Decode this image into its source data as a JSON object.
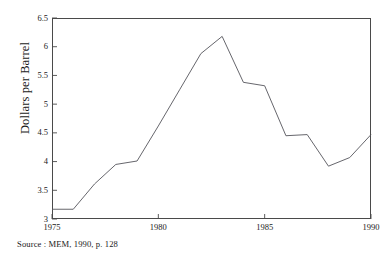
{
  "figure": {
    "source_note": "Source : MEM, 1990, p. 128"
  },
  "chart_data": {
    "type": "line",
    "title": "",
    "xlabel": "",
    "ylabel": "Dollars per Barrel",
    "x": [
      1975,
      1976,
      1977,
      1978,
      1979,
      1980,
      1981,
      1982,
      1983,
      1984,
      1985,
      1986,
      1987,
      1988,
      1989,
      1990
    ],
    "values": [
      3.17,
      3.17,
      3.61,
      3.95,
      4.01,
      4.62,
      5.25,
      5.88,
      6.18,
      5.38,
      5.32,
      4.45,
      4.47,
      3.92,
      4.07,
      4.47
    ],
    "series": [
      {
        "name": "Dollars per Barrel",
        "values": [
          3.17,
          3.17,
          3.61,
          3.95,
          4.01,
          4.62,
          5.25,
          5.88,
          6.18,
          5.38,
          5.32,
          4.45,
          4.47,
          3.92,
          4.07,
          4.47
        ]
      }
    ],
    "xlim": [
      1975,
      1990
    ],
    "ylim": [
      3,
      6.5
    ],
    "xticks": [
      1975,
      1980,
      1985,
      1990
    ],
    "xtick_labels": [
      "1975",
      "1980",
      "1985",
      "1990"
    ],
    "yticks": [
      3,
      3.5,
      4,
      4.5,
      5,
      5.5,
      6,
      6.5
    ],
    "ytick_labels": [
      "3",
      "3.5",
      "4",
      "4.5",
      "5",
      "5.5",
      "6",
      "6.5"
    ],
    "grid": false,
    "legend": false,
    "legend_position": "none",
    "line_color": "#55555b",
    "frame_color": "#4a4a4a"
  }
}
